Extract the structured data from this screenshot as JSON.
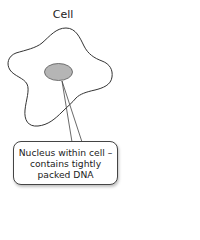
{
  "diagram": {
    "title": "Cell",
    "callout": {
      "lines": [
        "Nucleus within cell –",
        "contains tightly",
        "packed DNA"
      ]
    },
    "colors": {
      "outline": "#333333",
      "nucleus_fill": "#b5b5b5",
      "nucleus_stroke": "#555555",
      "background": "#ffffff"
    },
    "labels": {
      "cell": "Cell",
      "nucleus": "Nucleus"
    }
  }
}
